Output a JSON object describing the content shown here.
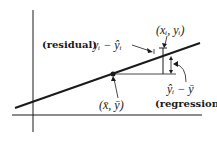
{
  "diagram": {
    "labels": {
      "residual_word": "(residual)",
      "residual_expr": "yᵢ − ŷᵢ",
      "point": "(xᵢ, yᵢ)",
      "mean_point": "(x̄, ȳ)",
      "regression_expr": "ŷᵢ − ȳ",
      "regression_word": "(regression)"
    },
    "colors": {
      "ink": "#1a1a1a",
      "background": "#ffffff"
    }
  }
}
